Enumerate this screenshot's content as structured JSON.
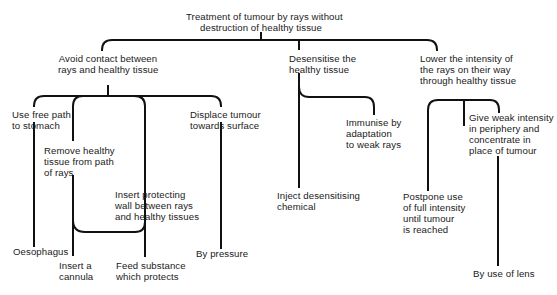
{
  "diagram": {
    "type": "tree",
    "root": {
      "id": "root",
      "label": "Treatment of tumour by rays without\ndestruction of healthy tissue"
    },
    "nodes": {
      "avoid": {
        "label": "Avoid contact between\nrays and healthy tissue",
        "parent": "root"
      },
      "desensitise": {
        "label": "Desensitise the\nhealthy tissue",
        "parent": "root"
      },
      "lower": {
        "label": "Lower the intensity of\nthe rays on their way\nthrough healthy tissue",
        "parent": "root"
      },
      "free_path": {
        "label": "Use free path\nto stomach",
        "parent": "avoid"
      },
      "remove": {
        "label": "Remove healthy\ntissue from path\nof rays",
        "parent": "avoid"
      },
      "wall": {
        "label": "Insert protecting\nwall between rays\nand healthy tissues",
        "parent": "avoid"
      },
      "displace": {
        "label": "Displace tumour\ntowards surface",
        "parent": "avoid"
      },
      "oesophagus": {
        "label": "Oesophagus",
        "parent": "free_path"
      },
      "cannula": {
        "label": "Insert a\ncannula",
        "parent": [
          "remove",
          "wall"
        ]
      },
      "feed": {
        "label": "Feed substance\nwhich protects",
        "parent": [
          "remove",
          "wall"
        ]
      },
      "pressure": {
        "label": "By pressure",
        "parent": "displace"
      },
      "immunise": {
        "label": "Immunise by\nadaptation\nto weak rays",
        "parent": "desensitise"
      },
      "inject": {
        "label": "Inject desensitising\nchemical",
        "parent": "desensitise"
      },
      "postpone": {
        "label": "Postpone use\nof full intensity\nuntil tumour\nis reached",
        "parent": "lower"
      },
      "weak": {
        "label": "Give weak intensity\nin periphery and\nconcentrate in\nplace of tumour",
        "parent": "lower"
      },
      "lens": {
        "label": "By use of lens",
        "parent": "weak"
      }
    }
  }
}
